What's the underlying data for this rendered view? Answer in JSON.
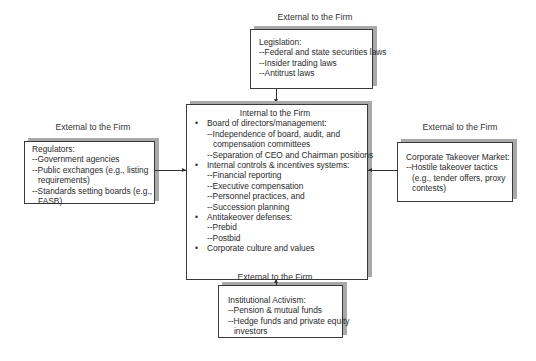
{
  "diagram": {
    "top": {
      "header": "External to the Firm",
      "title": "Legislation:",
      "items": [
        "--Federal and state securities laws",
        "--Insider trading laws",
        "--Antitrust laws"
      ]
    },
    "left": {
      "header": "External to the Firm",
      "title": "Regulators:",
      "lines": [
        "--Government agencies",
        "--Public exchanges (e.g., listing",
        "requirements)",
        "--Standards setting boards (e.g.,",
        "FASB)"
      ]
    },
    "right": {
      "header": "External to the Firm",
      "title": "Corporate Takeover Market:",
      "lines": [
        "--Hostile takeover tactics",
        "(e.g., tender offers, proxy",
        "contests)"
      ]
    },
    "bottom": {
      "header": "External to the Firm",
      "title": "Institutional Activism:",
      "lines": [
        "--Pension & mutual funds",
        "--Hedge funds and private equity",
        "investors"
      ]
    },
    "center": {
      "header": "Internal to the Firm",
      "bullet": "•",
      "sections": [
        {
          "title": "Board of directors/management:",
          "lines": [
            "--Independence of board, audit, and",
            "compensation committees",
            "--Separation of CEO and Chairman positions"
          ]
        },
        {
          "title": "Internal controls & incentives systems:",
          "lines": [
            "--Financial reporting",
            "--Executive compensation",
            "--Personnel practices, and",
            "--Succession planning"
          ]
        },
        {
          "title": "Antitakeover defenses:",
          "lines": [
            "--Prebid",
            "--Postbid"
          ]
        },
        {
          "title": "Corporate culture and values",
          "lines": []
        }
      ]
    }
  }
}
